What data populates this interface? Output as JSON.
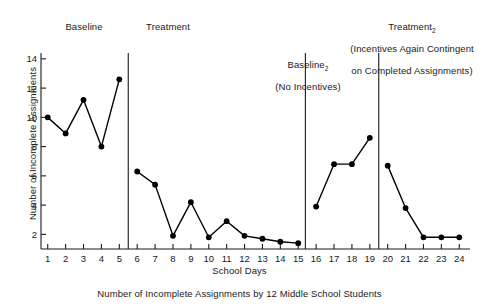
{
  "chart_data": {
    "type": "line",
    "title": "",
    "caption": "Number of Incomplete Assignments by 12 Middle School Students",
    "xlabel": "School Days",
    "ylabel": "Number of Incomplete Assignments",
    "xlim": [
      0.4,
      24.6
    ],
    "ylim": [
      1.0,
      14.4
    ],
    "yticks": [
      2,
      4,
      6,
      8,
      10,
      12,
      14
    ],
    "ytick_labels": [
      "2",
      "4",
      "6",
      "8",
      "10",
      "12",
      "14"
    ],
    "xticks": [
      1,
      2,
      3,
      4,
      5,
      6,
      7,
      8,
      9,
      10,
      11,
      12,
      13,
      14,
      15,
      16,
      17,
      18,
      19,
      20,
      21,
      22,
      23,
      24
    ],
    "xtick_labels": [
      "1",
      "2",
      "3",
      "4",
      "5",
      "6",
      "7",
      "8",
      "9",
      "10",
      "11",
      "12",
      "13",
      "14",
      "15",
      "16",
      "17",
      "18",
      "19",
      "20",
      "21",
      "22",
      "23",
      "24"
    ],
    "grid": false,
    "legend": "none",
    "marker": "filled-circle",
    "line_color": "#000000",
    "marker_color": "#000000",
    "phase_dividers": [
      5.5,
      15.4,
      19.5
    ],
    "phases": [
      {
        "name": "baseline-1",
        "label": "Baseline",
        "label_sub": "",
        "label_lines": [
          "Baseline"
        ],
        "x_range": [
          1,
          5
        ],
        "x": [
          1,
          2,
          3,
          4,
          5
        ],
        "values": [
          10.0,
          8.9,
          11.2,
          8.0,
          12.6
        ]
      },
      {
        "name": "treatment-1",
        "label": "Treatment",
        "label_sub": "",
        "label_lines": [
          "Treatment"
        ],
        "x_range": [
          6,
          15
        ],
        "x": [
          6,
          7,
          8,
          9,
          10,
          11,
          12,
          13,
          14,
          15
        ],
        "values": [
          6.3,
          5.4,
          1.9,
          4.2,
          1.8,
          2.9,
          1.9,
          1.7,
          1.5,
          1.4
        ]
      },
      {
        "name": "baseline-2",
        "label": "Baseline",
        "label_sub": "2",
        "label_lines": [
          "Baseline2",
          "(No Incentives)"
        ],
        "x_range": [
          16,
          19
        ],
        "x": [
          16,
          17,
          18,
          19
        ],
        "values": [
          3.9,
          6.8,
          6.8,
          8.6
        ]
      },
      {
        "name": "treatment-2",
        "label": "Treatment",
        "label_sub": "2",
        "label_lines": [
          "Treatment2",
          "(Incentives Again Contingent",
          "on Completed Assignments)"
        ],
        "x_range": [
          20,
          24
        ],
        "x": [
          20,
          21,
          22,
          23,
          24
        ],
        "values": [
          6.7,
          3.8,
          1.8,
          1.8,
          1.8
        ]
      }
    ]
  },
  "labels": {
    "phase_baseline1": "Baseline",
    "phase_treatment1": "Treatment",
    "phase_baseline2_line1": "Baseline",
    "phase_baseline2_sub": "2",
    "phase_baseline2_line2": "(No Incentives)",
    "phase_treatment2_line1": "Treatment",
    "phase_treatment2_sub": "2",
    "phase_treatment2_line2": "(Incentives Again Contingent",
    "phase_treatment2_line3": "on Completed Assignments)",
    "y_axis_title": "Number of Incomplete Assignments",
    "x_axis_title": "School Days",
    "caption": "Number of Incomplete Assignments by 12 Middle School Students"
  }
}
